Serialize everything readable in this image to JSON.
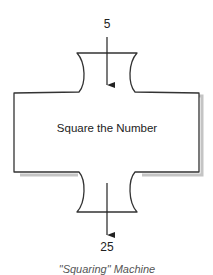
{
  "diagram": {
    "input_value": "5",
    "process_label": "Square the Number",
    "output_value": "25",
    "caption": "\"Squaring\" Machine",
    "colors": {
      "stroke": "#333333",
      "shadow": "#bbbbbb",
      "fill": "#ffffff",
      "background": "#ffffff"
    }
  }
}
